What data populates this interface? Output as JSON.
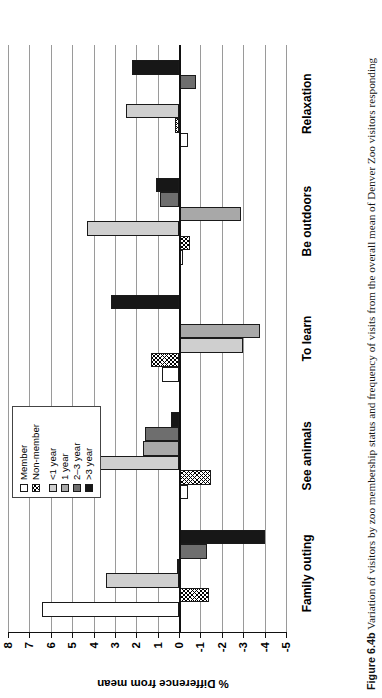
{
  "figure": {
    "number": "Figure 6.4b",
    "caption": "Variation of visitors by zoo membership status and frequency of visits from the overall mean of Denver Zoo visitors responding"
  },
  "legend": {
    "items": [
      {
        "label": "Member",
        "swatch": "white-empty",
        "class": "sw-member"
      },
      {
        "label": "Non-member",
        "swatch": "crosshatch",
        "class": "sw-nonmember"
      },
      {
        "label": "<1 year",
        "swatch": "light-gray",
        "class": "sw-y1"
      },
      {
        "label": "1 year",
        "swatch": "medium-gray",
        "class": "sw-y2"
      },
      {
        "label": "2–3 year",
        "swatch": "dark-gray",
        "class": "sw-y3"
      },
      {
        "label": ">3 year",
        "swatch": "black",
        "class": "sw-y4"
      }
    ]
  },
  "chart_data": {
    "type": "bar",
    "orientation": "vertical",
    "title": "",
    "xlabel": "",
    "ylabel": "% Difference from mean",
    "ylim": [
      -5,
      8
    ],
    "yticks": [
      8,
      7,
      6,
      5,
      4,
      3,
      2,
      1,
      0,
      -1,
      -2,
      -3,
      -4,
      -5
    ],
    "ytick_labels": [
      "8",
      "7",
      "6",
      "5",
      "4",
      "3",
      "2",
      "1",
      "0",
      "-1",
      "-2",
      "-3",
      "-4",
      "-5"
    ],
    "grid": true,
    "legend_position": "top-center",
    "categories": [
      "Family outing",
      "See animals",
      "To learn",
      "Be outdoors",
      "Relaxation"
    ],
    "series": [
      {
        "name": "Member",
        "values": [
          6.4,
          -0.4,
          0.8,
          -0.2,
          -0.4
        ]
      },
      {
        "name": "Non-member",
        "values": [
          -1.4,
          -1.5,
          1.3,
          -0.5,
          0.2
        ]
      },
      {
        "name": "<1 year",
        "values": [
          3.4,
          7.5,
          -3.0,
          4.3,
          2.5
        ]
      },
      {
        "name": "1 year",
        "values": [
          0.1,
          1.7,
          -3.8,
          -2.9,
          -0.1
        ]
      },
      {
        "name": "2–3 year",
        "values": [
          -1.3,
          1.6,
          -0.1,
          0.9,
          -0.8
        ]
      },
      {
        "name": ">3 year",
        "values": [
          -4.0,
          0.4,
          3.2,
          1.1,
          2.2
        ]
      }
    ]
  }
}
